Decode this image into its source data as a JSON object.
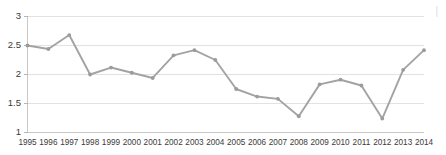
{
  "chart_data": {
    "type": "line",
    "title": "",
    "subtitle": "",
    "xlabel": "",
    "ylabel": "",
    "categories": [
      "1995",
      "1996",
      "1997",
      "1998",
      "1999",
      "2000",
      "2001",
      "2002",
      "2003",
      "2004",
      "2005",
      "2006",
      "2007",
      "2008",
      "2009",
      "2010",
      "2011",
      "2012",
      "2013",
      "2014"
    ],
    "values": [
      2.5,
      2.44,
      2.68,
      2.0,
      2.12,
      2.03,
      1.94,
      2.33,
      2.42,
      2.25,
      1.75,
      1.62,
      1.58,
      1.28,
      1.83,
      1.91,
      1.81,
      1.24,
      2.08,
      2.42
    ],
    "series": [
      {
        "name": "",
        "values": [
          2.5,
          2.44,
          2.68,
          2.0,
          2.12,
          2.03,
          1.94,
          2.33,
          2.42,
          2.25,
          1.75,
          1.62,
          1.58,
          1.28,
          1.83,
          1.91,
          1.81,
          1.24,
          2.08,
          2.42
        ]
      }
    ],
    "ylim": [
      1,
      3
    ],
    "xlim": [
      "1995",
      "2014"
    ],
    "yticks": [
      1,
      1.5,
      2,
      2.5,
      3
    ],
    "ytick_labels": [
      "1",
      "1.5",
      "2",
      "2.5",
      "3"
    ],
    "xtick_labels": [
      "1995",
      "1996",
      "1997",
      "1998",
      "1999",
      "2000",
      "2001",
      "2002",
      "2003",
      "2004",
      "2005",
      "2006",
      "2007",
      "2008",
      "2009",
      "2010",
      "2011",
      "2012",
      "2013",
      "2014"
    ],
    "grid": true,
    "grid_axis": "y",
    "legend": false,
    "legend_position": "none",
    "annotations": [],
    "colors": {
      "line": "#a3a3a3",
      "marker": "#9b9b9b",
      "grid": "#e2e2e2",
      "axis": "#c9c9c9",
      "tick_text": "#3a3a3a",
      "background": "#ffffff"
    }
  }
}
